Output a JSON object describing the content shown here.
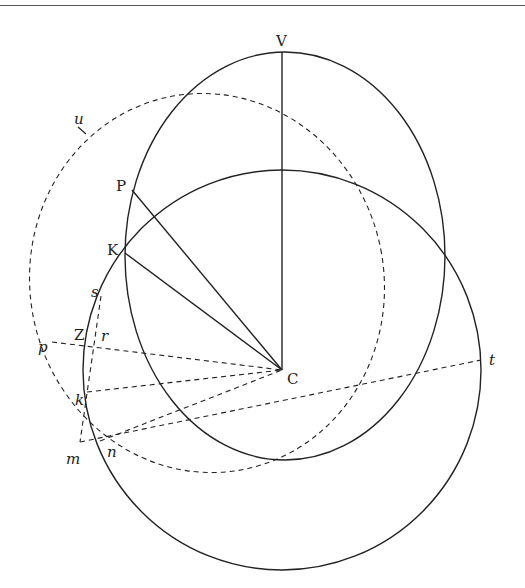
{
  "figure": {
    "stroke_color": "#222222",
    "background": "#ffffff"
  },
  "curves": [
    {
      "id": "upper-ellipse",
      "style": "solid",
      "cx": 285,
      "cy": 256,
      "rx": 160,
      "ry": 204,
      "rotate": 0
    },
    {
      "id": "lower-circle",
      "style": "solid",
      "cx": 282,
      "cy": 370,
      "rx": 199,
      "ry": 200,
      "rotate": 0
    },
    {
      "id": "dashed-ellipse",
      "style": "dashed",
      "cx": 207,
      "cy": 283,
      "rx": 177,
      "ry": 190,
      "rotate": -11
    }
  ],
  "points": {
    "V": [
      282,
      52
    ],
    "P": [
      132,
      190
    ],
    "K": [
      125,
      253
    ],
    "C": [
      282,
      370
    ],
    "s": [
      101,
      296
    ],
    "Z": [
      93,
      348
    ],
    "r": [
      94,
      348
    ],
    "p": [
      52,
      342
    ],
    "k": [
      87,
      392
    ],
    "m": [
      80,
      442
    ],
    "n": [
      100,
      441
    ],
    "t": [
      481,
      360
    ],
    "u": [
      82,
      130
    ]
  },
  "segments": [
    {
      "from": "V",
      "to": "C",
      "style": "solid"
    },
    {
      "from": "P",
      "to": "C",
      "style": "solid"
    },
    {
      "from": "K",
      "to": "C",
      "style": "solid"
    },
    {
      "from": "p",
      "to": "C",
      "style": "dashed"
    },
    {
      "from": "k",
      "to": "C",
      "style": "dashed"
    },
    {
      "from": "n",
      "to": "C",
      "style": "dashed"
    },
    {
      "from": "m",
      "to": "t",
      "style": "dashed"
    },
    {
      "from": "s",
      "to": "m",
      "style": "dashed"
    }
  ],
  "labels": {
    "V": {
      "text": "V",
      "x": 276,
      "y": 46
    },
    "P": {
      "text": "P",
      "x": 116,
      "y": 191
    },
    "K": {
      "text": "K",
      "x": 107,
      "y": 255
    },
    "C": {
      "text": "C",
      "x": 287,
      "y": 384
    },
    "s": {
      "text": "s",
      "x": 91,
      "y": 297
    },
    "Z": {
      "text": "Z",
      "x": 74,
      "y": 340
    },
    "r": {
      "text": "r",
      "x": 101,
      "y": 341
    },
    "p": {
      "text": "p",
      "x": 38,
      "y": 352
    },
    "k": {
      "text": "k",
      "x": 75,
      "y": 405
    },
    "m": {
      "text": "m",
      "x": 66,
      "y": 464
    },
    "n": {
      "text": "n",
      "x": 107,
      "y": 457
    },
    "t": {
      "text": "t",
      "x": 489,
      "y": 365
    },
    "u": {
      "text": "u",
      "x": 74,
      "y": 124
    }
  }
}
